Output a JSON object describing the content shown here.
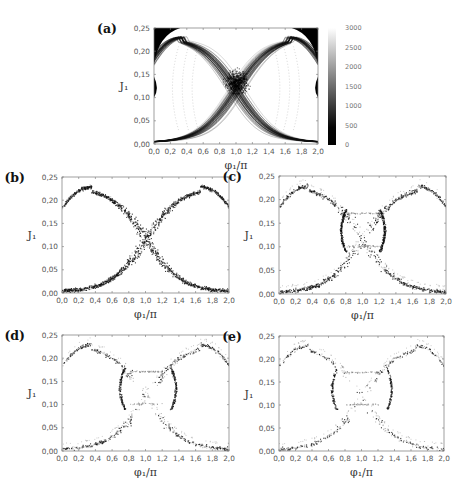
{
  "figure": {
    "panels": [
      {
        "id": "a",
        "label": "(a)",
        "frame": [
          154,
          28,
          318,
          144
        ],
        "kind": "density-map"
      },
      {
        "id": "b",
        "label": "(b)",
        "frame": [
          62,
          177,
          229,
          293
        ],
        "kind": "scatter",
        "intensity": 1.0
      },
      {
        "id": "c",
        "label": "(c)",
        "frame": [
          279,
          176,
          446,
          294
        ],
        "kind": "scatter",
        "intensity": 0.6
      },
      {
        "id": "d",
        "label": "(d)",
        "frame": [
          62,
          335,
          229,
          451
        ],
        "kind": "scatter",
        "intensity": 0.35
      },
      {
        "id": "e",
        "label": "(e)",
        "frame": [
          279,
          336,
          444,
          451
        ],
        "kind": "scatter",
        "intensity": 0.22
      }
    ],
    "xlabel": "φ₁/π",
    "ylabel": "J₁",
    "xticks": [
      "0,0",
      "0,2",
      "0,4",
      "0,6",
      "0,8",
      "1,0",
      "1,2",
      "1,4",
      "1,6",
      "1,8",
      "2,0"
    ],
    "yticks": [
      "0,00",
      "0,05",
      "0,10",
      "0,15",
      "0,20",
      "0,25"
    ],
    "colorbar": {
      "frame": [
        328,
        28,
        336,
        145
      ],
      "ticks": [
        "0",
        "500",
        "1000",
        "1500",
        "2000",
        "2500",
        "3000"
      ]
    }
  },
  "chart_data": [
    {
      "panel": "a",
      "type": "heatmap",
      "title": "(a)",
      "xlabel": "φ₁/π",
      "ylabel": "J₁",
      "xlim": [
        0.0,
        2.0
      ],
      "ylim": [
        0.0,
        0.25
      ],
      "colorbar": {
        "range": [
          0,
          3000
        ],
        "ticks": [
          0,
          500,
          1000,
          1500,
          2000,
          2500,
          3000
        ],
        "colormap": "gray (black=0, white=3000)"
      },
      "description": "X-shaped separatrix band crossing at φ₁/π≈1.0, J₁≈0.13; arcs peak at J₁≈0.23 near φ₁/π≈0.35 and 1.65; black regions in upper corners and at J₁≈0.10–0.14 at both edges",
      "features": {
        "crossing_point": [
          1.0,
          0.135
        ],
        "arc_peaks": [
          [
            0.35,
            0.23
          ],
          [
            1.65,
            0.23
          ]
        ],
        "arc_minimum": [
          [
            0.05,
            0.003
          ],
          [
            1.95,
            0.003
          ]
        ]
      }
    },
    {
      "panel": "b",
      "type": "scatter",
      "title": "(b)",
      "xlabel": "φ₁/π",
      "ylabel": "J₁",
      "xlim": [
        0.0,
        2.0
      ],
      "ylim": [
        0.0,
        0.25
      ],
      "description": "Dense X-shaped point cloud; dense core around φ₁/π≈0.85–1.15, J₁≈0.10–0.17",
      "features": {
        "crossing_point": [
          1.0,
          0.135
        ],
        "arc_peaks": [
          [
            0.35,
            0.23
          ],
          [
            1.65,
            0.23
          ]
        ]
      }
    },
    {
      "panel": "c",
      "type": "scatter",
      "title": "(c)",
      "xlabel": "φ₁/π",
      "ylabel": "J₁",
      "xlim": [
        0.0,
        2.0
      ],
      "ylim": [
        0.0,
        0.25
      ],
      "description": "Sparser X-shape; dense walls at φ₁/π≈0.8 and 1.2 between J₁≈0.10–0.17; hollow center"
    },
    {
      "panel": "d",
      "type": "scatter",
      "title": "(d)",
      "xlabel": "φ₁/π",
      "ylabel": "J₁",
      "xlim": [
        0.0,
        2.0
      ],
      "ylim": [
        0.0,
        0.25
      ],
      "description": "Split band: two crescents at φ₁/π≈0.75 and 1.3; faint connecting arcs at J₁≈0.17 and 0.10"
    },
    {
      "panel": "e",
      "type": "scatter",
      "title": "(e)",
      "xlabel": "φ₁/π",
      "ylabel": "J₁",
      "xlim": [
        0.0,
        2.0
      ],
      "ylim": [
        0.0,
        0.25
      ],
      "description": "Sparsest; thin crescents at φ₁/π≈0.7 and 1.3; upper arc min at J₁≈0.17, lower arc max at J₁≈0.10"
    }
  ]
}
